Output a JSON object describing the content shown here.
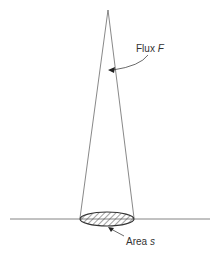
{
  "diagram": {
    "labels": {
      "flux": {
        "text": "Flux ",
        "symbol": "F"
      },
      "area": {
        "text": "Area ",
        "symbol": "s"
      }
    },
    "colors": {
      "line": "#555555",
      "hatch": "#444444",
      "text": "#333333"
    }
  }
}
